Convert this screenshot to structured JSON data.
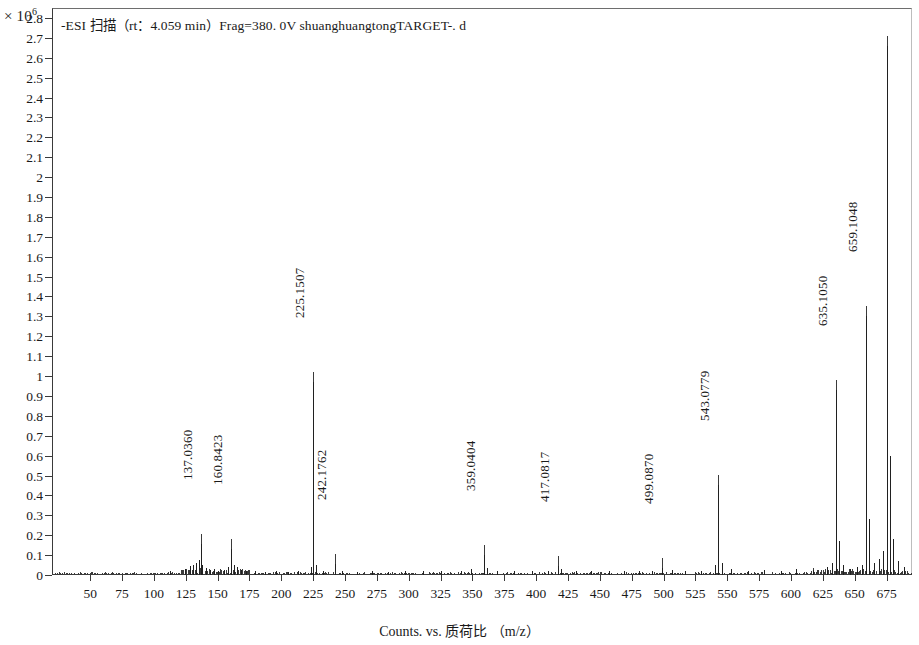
{
  "chart_data": {
    "type": "line",
    "title": "-ESI  扫描（rt：4.059 min）Frag=380. 0V shuanghuangtongTARGET-. d",
    "xlabel": "Counts. vs. 质荷比 （m/z）",
    "ylabel": "",
    "y_exponent_prefix": "× 10",
    "y_exponent_power": "6",
    "xlim": [
      20,
      695
    ],
    "ylim": [
      0,
      2.85
    ],
    "grid": false,
    "legend": null,
    "xticks": [
      50,
      75,
      100,
      125,
      150,
      175,
      200,
      225,
      250,
      275,
      300,
      325,
      350,
      375,
      400,
      425,
      450,
      475,
      500,
      525,
      550,
      575,
      600,
      625,
      650,
      675
    ],
    "yticks": [
      "0",
      "0.1",
      "0.2",
      "0.3",
      "0.4",
      "0.5",
      "0.6",
      "0.7",
      "0.8",
      "0.9",
      "1",
      "1.1",
      "1.2",
      "1.3",
      "1.4",
      "1.5",
      "1.6",
      "1.7",
      "1.8",
      "1.9",
      "2",
      "2.1",
      "2.2",
      "2.3",
      "2.4",
      "2.5",
      "2.6",
      "2.7",
      "2.8"
    ],
    "labeled_peaks": [
      {
        "mz": 137.036,
        "label": "137.0360",
        "intensity": 0.155
      },
      {
        "mz": 160.8423,
        "label": "160.8423",
        "intensity": 0.13
      },
      {
        "mz": 225.1507,
        "label": "225.1507",
        "intensity": 0.97
      },
      {
        "mz": 242.1762,
        "label": "242.1762",
        "intensity": 0.055
      },
      {
        "mz": 359.0404,
        "label": "359.0404",
        "intensity": 0.1
      },
      {
        "mz": 417.0817,
        "label": "417.0817",
        "intensity": 0.045
      },
      {
        "mz": 499.087,
        "label": "499.0870",
        "intensity": 0.035
      },
      {
        "mz": 543.0779,
        "label": "543.0779",
        "intensity": 0.45
      },
      {
        "mz": 635.105,
        "label": "635.1050",
        "intensity": 0.93
      },
      {
        "mz": 659.1048,
        "label": "659.1048",
        "intensity": 1.3
      },
      {
        "mz": 675.0997,
        "label": "675.0997",
        "intensity": 2.66
      }
    ],
    "unlabeled_peaks": [
      {
        "mz": 112.9,
        "intensity": 0.02
      },
      {
        "mz": 124.0,
        "intensity": 0.03
      },
      {
        "mz": 128.0,
        "intensity": 0.045
      },
      {
        "mz": 130.5,
        "intensity": 0.05
      },
      {
        "mz": 133.0,
        "intensity": 0.06
      },
      {
        "mz": 135.0,
        "intensity": 0.075
      },
      {
        "mz": 138.0,
        "intensity": 0.05
      },
      {
        "mz": 141.0,
        "intensity": 0.035
      },
      {
        "mz": 144.0,
        "intensity": 0.025
      },
      {
        "mz": 147.0,
        "intensity": 0.03
      },
      {
        "mz": 150.5,
        "intensity": 0.02
      },
      {
        "mz": 155.0,
        "intensity": 0.025
      },
      {
        "mz": 158.5,
        "intensity": 0.04
      },
      {
        "mz": 162.5,
        "intensity": 0.05
      },
      {
        "mz": 165.0,
        "intensity": 0.04
      },
      {
        "mz": 168.0,
        "intensity": 0.025
      },
      {
        "mz": 172.0,
        "intensity": 0.02
      },
      {
        "mz": 179.0,
        "intensity": 0.018
      },
      {
        "mz": 187.0,
        "intensity": 0.015
      },
      {
        "mz": 196.0,
        "intensity": 0.02
      },
      {
        "mz": 205.0,
        "intensity": 0.015
      },
      {
        "mz": 213.0,
        "intensity": 0.02
      },
      {
        "mz": 223.0,
        "intensity": 0.04
      },
      {
        "mz": 227.0,
        "intensity": 0.05
      },
      {
        "mz": 233.0,
        "intensity": 0.02
      },
      {
        "mz": 248.0,
        "intensity": 0.018
      },
      {
        "mz": 259.0,
        "intensity": 0.015
      },
      {
        "mz": 271.0,
        "intensity": 0.018
      },
      {
        "mz": 284.0,
        "intensity": 0.015
      },
      {
        "mz": 297.0,
        "intensity": 0.02
      },
      {
        "mz": 311.0,
        "intensity": 0.018
      },
      {
        "mz": 325.0,
        "intensity": 0.022
      },
      {
        "mz": 341.0,
        "intensity": 0.02
      },
      {
        "mz": 349.0,
        "intensity": 0.03
      },
      {
        "mz": 361.5,
        "intensity": 0.035
      },
      {
        "mz": 369.0,
        "intensity": 0.02
      },
      {
        "mz": 383.0,
        "intensity": 0.018
      },
      {
        "mz": 397.0,
        "intensity": 0.02
      },
      {
        "mz": 409.0,
        "intensity": 0.022
      },
      {
        "mz": 419.5,
        "intensity": 0.03
      },
      {
        "mz": 431.0,
        "intensity": 0.02
      },
      {
        "mz": 443.0,
        "intensity": 0.018
      },
      {
        "mz": 457.0,
        "intensity": 0.02
      },
      {
        "mz": 469.0,
        "intensity": 0.018
      },
      {
        "mz": 481.0,
        "intensity": 0.022
      },
      {
        "mz": 491.0,
        "intensity": 0.02
      },
      {
        "mz": 507.0,
        "intensity": 0.025
      },
      {
        "mz": 517.0,
        "intensity": 0.02
      },
      {
        "mz": 529.0,
        "intensity": 0.022
      },
      {
        "mz": 540.0,
        "intensity": 0.05
      },
      {
        "mz": 546.0,
        "intensity": 0.06
      },
      {
        "mz": 553.0,
        "intensity": 0.03
      },
      {
        "mz": 566.0,
        "intensity": 0.02
      },
      {
        "mz": 579.0,
        "intensity": 0.025
      },
      {
        "mz": 592.0,
        "intensity": 0.022
      },
      {
        "mz": 604.0,
        "intensity": 0.03
      },
      {
        "mz": 617.0,
        "intensity": 0.025
      },
      {
        "mz": 628.0,
        "intensity": 0.04
      },
      {
        "mz": 632.0,
        "intensity": 0.06
      },
      {
        "mz": 637.5,
        "intensity": 0.17
      },
      {
        "mz": 641.0,
        "intensity": 0.05
      },
      {
        "mz": 646.0,
        "intensity": 0.03
      },
      {
        "mz": 652.0,
        "intensity": 0.04
      },
      {
        "mz": 656.0,
        "intensity": 0.05
      },
      {
        "mz": 661.5,
        "intensity": 0.28
      },
      {
        "mz": 665.0,
        "intensity": 0.06
      },
      {
        "mz": 669.0,
        "intensity": 0.08
      },
      {
        "mz": 672.0,
        "intensity": 0.12
      },
      {
        "mz": 677.5,
        "intensity": 0.6
      },
      {
        "mz": 680.0,
        "intensity": 0.18
      },
      {
        "mz": 684.0,
        "intensity": 0.07
      },
      {
        "mz": 689.0,
        "intensity": 0.04
      }
    ]
  }
}
